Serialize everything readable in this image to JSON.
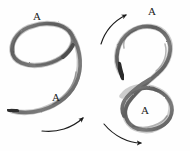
{
  "figure": {
    "background_color": "#fefefe",
    "ink_color": "#6a6a6a",
    "ink_dark_color": "#3a3a3a",
    "label_color": "#1b1b1b",
    "arrow_color": "#1c1c1c",
    "media": "pencil-sketch",
    "width": 190,
    "height": 151
  },
  "diagrams": [
    {
      "id": "left-knot",
      "name": "simple-loop-knot",
      "description": "hand-drawn pencil loop resembling a numeral nine with one crossing and a free tail",
      "labels": [
        {
          "id": "left-label-top",
          "text": "A",
          "x": 33,
          "y": 11
        },
        {
          "id": "left-label-bottom",
          "text": "A",
          "x": 52,
          "y": 92
        }
      ],
      "arrows": [
        {
          "id": "left-arrow-bottom",
          "text": "",
          "direction": "up-right",
          "sweep": "clockwise"
        }
      ]
    },
    {
      "id": "right-knot",
      "name": "figure-eight-knot",
      "description": "hand-drawn pencil figure-eight with an upper round loop, a central crossing, a lower triangular loop, and a free end on the left",
      "labels": [
        {
          "id": "right-label-top",
          "text": "A",
          "x": 148,
          "y": 6
        },
        {
          "id": "right-label-bottom",
          "text": "A",
          "x": 141,
          "y": 105
        }
      ],
      "arrows": [
        {
          "id": "right-arrow-top",
          "text": "",
          "direction": "up-right",
          "sweep": "counter-clockwise"
        },
        {
          "id": "right-arrow-bottom",
          "text": "",
          "direction": "down-right",
          "sweep": "clockwise"
        }
      ]
    }
  ]
}
